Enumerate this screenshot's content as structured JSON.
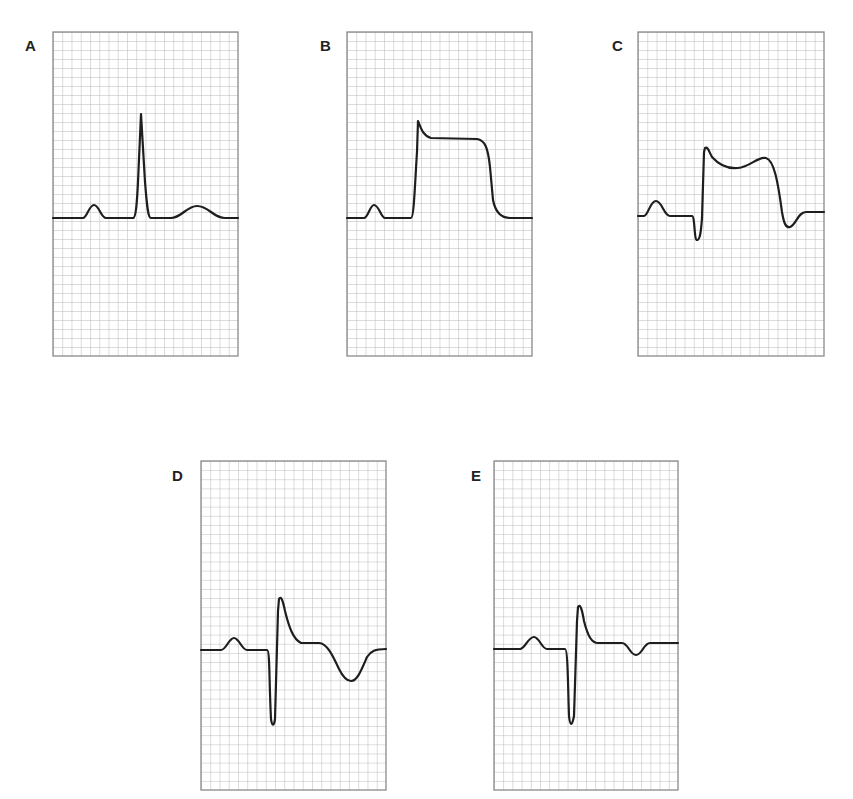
{
  "figure": {
    "grid_color": "#b8b8b8",
    "frame_color": "#8a8a8a",
    "trace_color": "#1e1e1e"
  },
  "panels": [
    {
      "label": "A",
      "description": "Normal complex: P wave, narrow upright QRS, upright T wave",
      "box": {
        "x": 53,
        "y": 32,
        "w": 185,
        "h": 324
      },
      "label_pos": {
        "x": 25,
        "y": 39
      },
      "trace": "M0,186 L30,186 C34,186 36,173 41,173 C46,173 48,186 53,186 L80,186 C83,186 84,170 85,150 L88,82 L92,150 C94,175 95,186 98,186 L118,186 C128,186 134,174 144,174 C156,174 160,186 172,186 L185,186"
    },
    {
      "label": "B",
      "description": "Marked ST elevation with tombstone/plateau morphology (hyperacute injury)",
      "box": {
        "x": 347,
        "y": 32,
        "w": 185,
        "h": 324
      },
      "label_pos": {
        "x": 320,
        "y": 39
      },
      "trace": "M0,186 L17,186 C21,186 23,173 27,173 C32,173 34,186 38,186 L64,186 C67,186 68,150 70,120 L71,89 C74,96 76,104 84,106 L130,107 C138,108 141,116 143,135 L146,168 C148,178 152,186 163,186 L185,186"
    },
    {
      "label": "C",
      "description": "ST elevation with small Q wave and dome-shaped ST segment",
      "box": {
        "x": 638,
        "y": 32,
        "w": 186,
        "h": 324
      },
      "label_pos": {
        "x": 612,
        "y": 39
      },
      "trace": "M0,184 L6,184 C10,184 12,169 18,169 C24,169 26,184 32,184 L54,184 C57,184 56,208 59,208 C62,208 63,200 64,186 L66,120 L67,116 C70,114 71,120 74,125 C82,134 90,137 100,136 C112,135 120,124 128,126 C136,128 140,150 144,180 C146,192 148,196 152,195 C158,193 160,180 168,180 L186,180"
    },
    {
      "label": "D",
      "description": "Q wave with residual ST elevation and deep T-wave inversion",
      "box": {
        "x": 201,
        "y": 461,
        "w": 185,
        "h": 329
      },
      "label_pos": {
        "x": 172,
        "y": 469
      },
      "trace": "M0,189 L20,189 C25,189 28,177 33,177 C38,177 41,189 46,189 L66,189 C69,189 68,220 70,258 C71,265 73,266 74,258 L77,150 L78,138 C80,134 82,140 84,150 C88,166 92,178 100,182 L118,182 C126,182 132,195 138,208 C142,216 146,220 150,220 C156,220 160,210 166,196 C170,190 174,188 185,188"
    },
    {
      "label": "E",
      "description": "Q wave with near-isoelectric ST segment and shallow T-wave inversion",
      "box": {
        "x": 494,
        "y": 461,
        "w": 184,
        "h": 329
      },
      "label_pos": {
        "x": 471,
        "y": 469
      },
      "trace": "M0,188 L26,188 C31,188 34,176 40,176 C45,176 48,188 53,188 L71,188 C74,188 74,230 75,255 C76,265 78,266 80,255 L83,160 L84,146 C86,142 88,148 90,160 C94,176 98,182 104,182 L128,182 C134,182 136,194 142,194 C148,194 150,182 156,182 L184,182"
    }
  ]
}
